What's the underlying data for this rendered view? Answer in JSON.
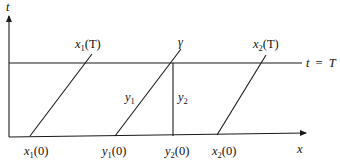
{
  "diagram": {
    "type": "characteristics-space-time-diagram",
    "axes": {
      "vertical_label": "t",
      "horizontal_label": "x"
    },
    "horizontal_line_label": {
      "lhs": "t",
      "eq": "=",
      "rhs": "T"
    },
    "characteristic_lines": [
      {
        "name": "x1",
        "bottom_label": {
          "base": "x",
          "sub": "1",
          "arg": "(0)"
        },
        "top_label": {
          "base": "x",
          "sub": "1",
          "arg": "(T)"
        }
      },
      {
        "name": "y1-line",
        "bottom_label": {
          "base": "y",
          "sub": "1",
          "arg": "(0)"
        },
        "segment_label": {
          "base": "y",
          "sub": "1"
        },
        "top_label": "γ"
      },
      {
        "name": "x2",
        "bottom_label": {
          "base": "x",
          "sub": "2",
          "arg": "(0)"
        },
        "top_label": {
          "base": "x",
          "sub": "2",
          "arg": "(T)"
        }
      }
    ],
    "vertical_segment": {
      "bottom_label": {
        "base": "y",
        "sub": "2",
        "arg": "(0)"
      },
      "segment_label": {
        "base": "y",
        "sub": "2"
      }
    }
  }
}
